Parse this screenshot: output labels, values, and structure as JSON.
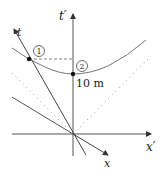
{
  "diagram": {
    "axes": {
      "t_prime": {
        "label": "t′"
      },
      "x_prime": {
        "label": "x′"
      },
      "t": {
        "label": "t"
      },
      "x": {
        "label": "x"
      }
    },
    "events": [
      {
        "id": "1",
        "label": "1"
      },
      {
        "id": "2",
        "label": "2"
      }
    ],
    "distance_label": "10 m",
    "colors": {
      "axis": "#444444",
      "curve": "#666666",
      "dotted": "#999999",
      "point": "#111111"
    }
  }
}
